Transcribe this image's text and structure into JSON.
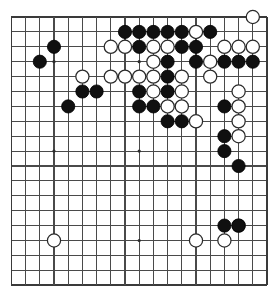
{
  "board": {
    "name": "go-board",
    "size": 19,
    "geometry": {
      "origin_x": 11.4,
      "origin_y": 17.0,
      "spacing_x": 14.2,
      "spacing_y": 14.9,
      "stone_radius": 6.6,
      "hoshi_radius": 1.6
    },
    "colors": {
      "background": "#ffffff",
      "grid_line": "#4a4a4a",
      "grid_border": "#3a3a3a",
      "black_stone": "#101010",
      "white_stone": "#ffffff",
      "white_stone_outline": "#2a2a2a",
      "hoshi": "#2b2b2b"
    },
    "hoshi_points": [
      [
        3,
        3
      ],
      [
        9,
        3
      ],
      [
        15,
        3
      ],
      [
        3,
        9
      ],
      [
        9,
        9
      ],
      [
        15,
        9
      ],
      [
        3,
        15
      ],
      [
        9,
        15
      ],
      [
        15,
        15
      ]
    ],
    "black_stones": [
      [
        8,
        1
      ],
      [
        9,
        1
      ],
      [
        10,
        1
      ],
      [
        11,
        1
      ],
      [
        12,
        1
      ],
      [
        14,
        1
      ],
      [
        3,
        2
      ],
      [
        9,
        2
      ],
      [
        12,
        2
      ],
      [
        13,
        2
      ],
      [
        2,
        3
      ],
      [
        11,
        3
      ],
      [
        13,
        3
      ],
      [
        15,
        3
      ],
      [
        16,
        3
      ],
      [
        17,
        3
      ],
      [
        11,
        4
      ],
      [
        5,
        5
      ],
      [
        6,
        5
      ],
      [
        9,
        5
      ],
      [
        11,
        5
      ],
      [
        4,
        6
      ],
      [
        9,
        6
      ],
      [
        10,
        6
      ],
      [
        15,
        6
      ],
      [
        11,
        7
      ],
      [
        12,
        7
      ],
      [
        15,
        8
      ],
      [
        15,
        9
      ],
      [
        16,
        10
      ],
      [
        15,
        14
      ],
      [
        16,
        14
      ]
    ],
    "white_stones": [
      [
        17,
        0
      ],
      [
        13,
        1
      ],
      [
        7,
        2
      ],
      [
        8,
        2
      ],
      [
        10,
        2
      ],
      [
        11,
        2
      ],
      [
        15,
        2
      ],
      [
        16,
        2
      ],
      [
        17,
        2
      ],
      [
        10,
        3
      ],
      [
        14,
        3
      ],
      [
        5,
        4
      ],
      [
        7,
        4
      ],
      [
        8,
        4
      ],
      [
        9,
        4
      ],
      [
        10,
        4
      ],
      [
        12,
        4
      ],
      [
        14,
        4
      ],
      [
        10,
        5
      ],
      [
        12,
        5
      ],
      [
        16,
        5
      ],
      [
        11,
        6
      ],
      [
        12,
        6
      ],
      [
        16,
        6
      ],
      [
        13,
        7
      ],
      [
        16,
        7
      ],
      [
        16,
        8
      ],
      [
        16,
        14
      ],
      [
        3,
        15
      ],
      [
        13,
        15
      ],
      [
        15,
        15
      ]
    ],
    "stone_counts": {
      "black_label": "Black",
      "white_label": "White",
      "black_count": 32,
      "white_count": 31
    }
  }
}
